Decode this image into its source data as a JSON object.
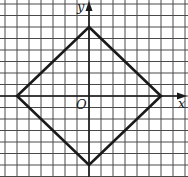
{
  "diagram": {
    "type": "coordinate-grid",
    "grid": {
      "origin_px": [
        89,
        96
      ],
      "cell_w": 12,
      "cell_h": 11.5,
      "x_units": [
        -7,
        8
      ],
      "y_units": [
        -7,
        8
      ],
      "line_color": "#4a4a4a",
      "axis_color": "#1a1a1a"
    },
    "axes": {
      "x_label": "x",
      "y_label": "y",
      "origin_label": "O"
    },
    "shape": {
      "name": "square (diamond)",
      "vertices": [
        [
          0,
          6
        ],
        [
          6,
          0
        ],
        [
          0,
          -6
        ],
        [
          -6,
          0
        ]
      ],
      "stroke_color": "#1a1a1a",
      "stroke_width": 2.6
    }
  }
}
